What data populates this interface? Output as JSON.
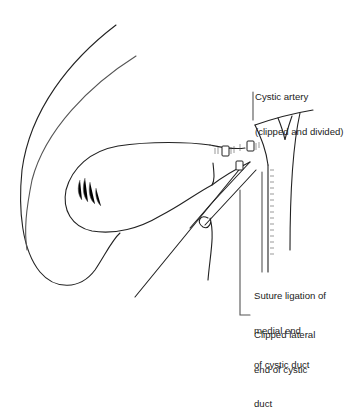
{
  "figure": {
    "labels": {
      "cystic_artery": {
        "lines": [
          "Cystic artery",
          "(clipped and divided)"
        ]
      },
      "suture_ligation": {
        "lines": [
          "Suture ligation of",
          "medial end",
          "of cystic duct"
        ]
      },
      "clipped_lateral": {
        "lines": [
          "Clipped lateral",
          "end of cystic",
          "duct"
        ]
      }
    },
    "structures": [
      "liver-edge",
      "gallbladder",
      "cystic-duct",
      "cystic-artery",
      "common-bile-duct",
      "forceps",
      "suture-thread"
    ],
    "colors": {
      "line": "#222222",
      "hatch": "#666666",
      "background": "#ffffff"
    }
  }
}
